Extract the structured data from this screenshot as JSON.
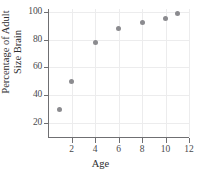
{
  "chart_data": {
    "type": "scatter",
    "title": "",
    "xlabel": "Age",
    "ylabel_lines": [
      "Percentage of Adult",
      "Size Brain"
    ],
    "ylabel": "Percentage of Adult Size Brain",
    "x": [
      1,
      2,
      4,
      6,
      8,
      10,
      11
    ],
    "values": [
      30,
      50,
      78,
      88,
      92,
      95,
      99
    ],
    "points": [
      {
        "x": 1,
        "y": 30
      },
      {
        "x": 2,
        "y": 50
      },
      {
        "x": 4,
        "y": 78
      },
      {
        "x": 6,
        "y": 88
      },
      {
        "x": 8,
        "y": 92
      },
      {
        "x": 10,
        "y": 95
      },
      {
        "x": 11,
        "y": 99
      }
    ],
    "xlim": [
      0,
      12
    ],
    "ylim": [
      10,
      102
    ],
    "xticks": [
      2,
      4,
      6,
      8,
      10,
      12
    ],
    "yticks": [
      20,
      40,
      60,
      80,
      100
    ],
    "xtick_labels": [
      "2",
      "4",
      "6",
      "8",
      "10",
      "12"
    ],
    "ytick_labels": [
      "20",
      "40",
      "60",
      "80",
      "100"
    ],
    "grid": true,
    "legend": "none",
    "marker_color": "#8b8b8f",
    "grid_color": "#ececed",
    "axis_color": "#6f6f72",
    "background": "#ffffff"
  }
}
